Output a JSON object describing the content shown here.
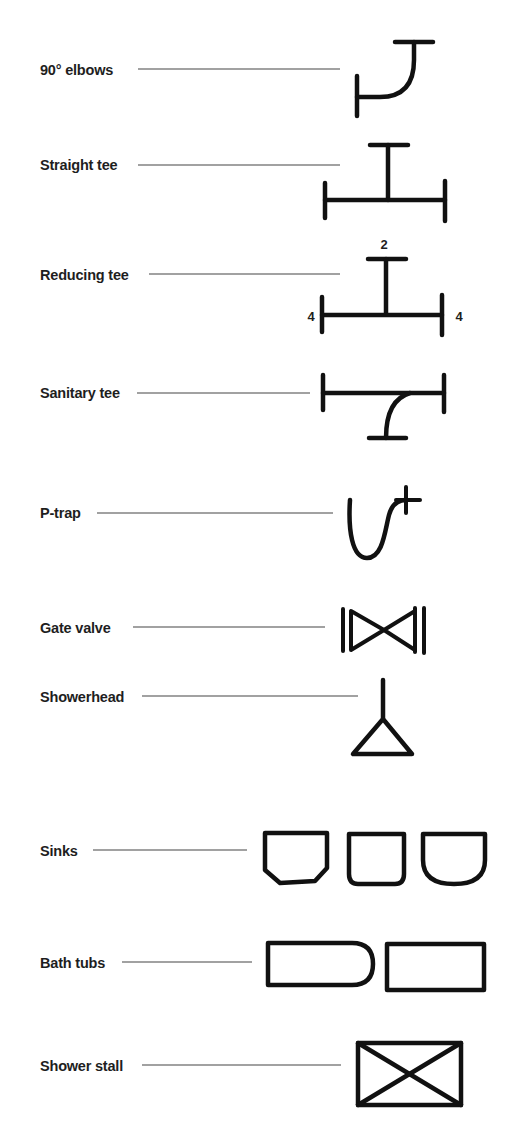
{
  "diagram": {
    "type": "plumbing-symbol-legend",
    "items": [
      {
        "label": "90° elbows",
        "symbol": "elbow-90"
      },
      {
        "label": "Straight tee",
        "symbol": "straight-tee"
      },
      {
        "label": "Reducing tee",
        "symbol": "reducing-tee",
        "annotations": {
          "top": "2",
          "left": "4",
          "right": "4"
        }
      },
      {
        "label": "Sanitary tee",
        "symbol": "sanitary-tee"
      },
      {
        "label": "P-trap",
        "symbol": "p-trap"
      },
      {
        "label": "Gate valve",
        "symbol": "gate-valve"
      },
      {
        "label": "Showerhead",
        "symbol": "showerhead"
      },
      {
        "label": "Sinks",
        "symbol": "sinks",
        "variants": 3
      },
      {
        "label": "Bath tubs",
        "symbol": "bath-tubs",
        "variants": 2
      },
      {
        "label": "Shower stall",
        "symbol": "shower-stall"
      }
    ],
    "colors": {
      "stroke": "#111111",
      "text": "#1e1e1e",
      "leader": "#444444",
      "background": "#ffffff"
    }
  }
}
